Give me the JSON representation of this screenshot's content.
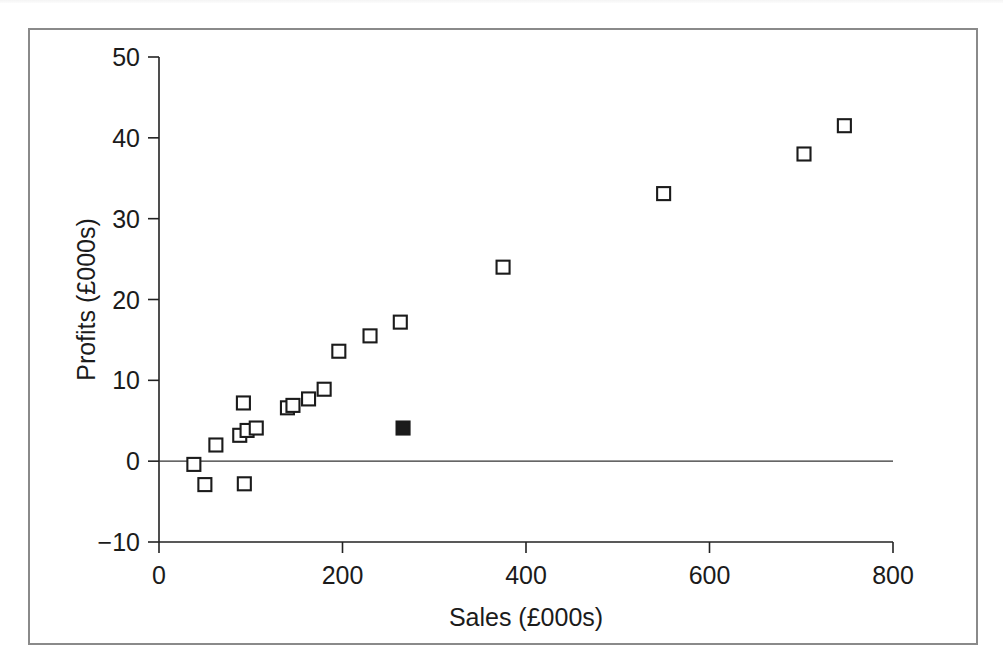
{
  "chart_data": {
    "type": "scatter",
    "title": "",
    "xlabel": "Sales (£000s)",
    "ylabel": "Profits (£000s)",
    "xlim": [
      0,
      800
    ],
    "ylim": [
      -10,
      50
    ],
    "xticks": [
      0,
      200,
      400,
      600,
      800
    ],
    "yticks": [
      -10,
      0,
      10,
      20,
      30,
      40,
      50
    ],
    "xtick_labels": [
      "0",
      "200",
      "400",
      "600",
      "800"
    ],
    "ytick_labels": [
      "−10",
      "0",
      "10",
      "20",
      "30",
      "40",
      "50"
    ],
    "grid": false,
    "legend": null,
    "reference_lines": [
      {
        "name": "zero-profit-line",
        "axis": "y",
        "value": 0
      }
    ],
    "series": [
      {
        "name": "Companies (open squares)",
        "marker": "open-square",
        "color": "#1b1b1b",
        "points": [
          {
            "x": 38,
            "y": -0.4
          },
          {
            "x": 50,
            "y": -2.9
          },
          {
            "x": 62,
            "y": 2.0
          },
          {
            "x": 88,
            "y": 3.2
          },
          {
            "x": 92,
            "y": 7.2
          },
          {
            "x": 93,
            "y": -2.8
          },
          {
            "x": 96,
            "y": 3.8
          },
          {
            "x": 106,
            "y": 4.1
          },
          {
            "x": 140,
            "y": 6.6
          },
          {
            "x": 146,
            "y": 6.9
          },
          {
            "x": 163,
            "y": 7.7
          },
          {
            "x": 180,
            "y": 8.9
          },
          {
            "x": 196,
            "y": 13.6
          },
          {
            "x": 230,
            "y": 15.5
          },
          {
            "x": 263,
            "y": 17.2
          },
          {
            "x": 375,
            "y": 24.0
          },
          {
            "x": 550,
            "y": 33.1
          },
          {
            "x": 703,
            "y": 38.0
          },
          {
            "x": 747,
            "y": 41.5
          }
        ]
      },
      {
        "name": "Highlighted company (filled square)",
        "marker": "filled-square",
        "color": "#1b1b1b",
        "points": [
          {
            "x": 266,
            "y": 4.1
          }
        ]
      }
    ]
  },
  "figure": {
    "background": "#ffffff",
    "frame_color": "#8a8a8a",
    "ink_color": "#1b1b1b"
  }
}
